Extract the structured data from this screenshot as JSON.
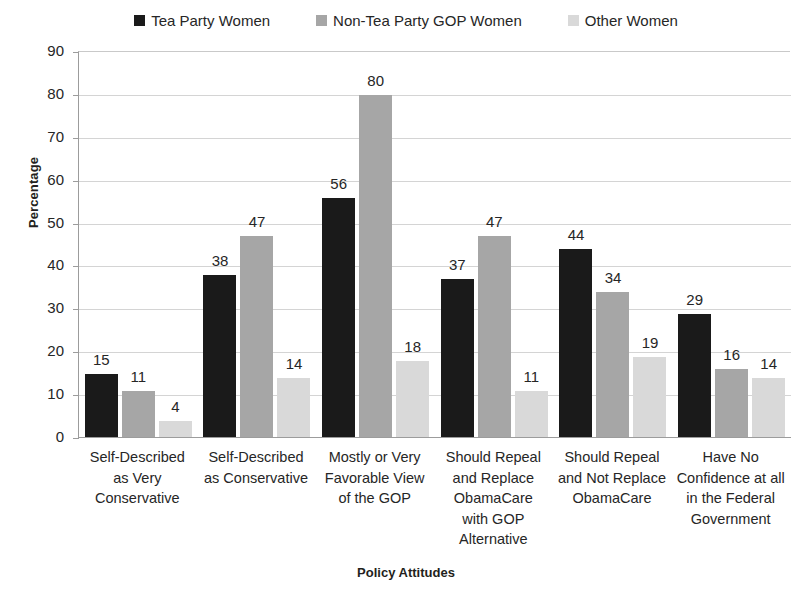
{
  "chart_data": {
    "type": "bar",
    "title": "",
    "xlabel": "Policy Attitudes",
    "ylabel": "Percentage",
    "ylim": [
      0,
      90
    ],
    "ytick_step": 10,
    "yticks": [
      90,
      80,
      70,
      60,
      50,
      40,
      30,
      20,
      10,
      0
    ],
    "grid": true,
    "legend_position": "top-center",
    "categories": [
      "Self-Described as Very Conservative",
      "Self-Described as Conservative",
      "Mostly or Very Favorable View of the GOP",
      "Should Repeal and Replace ObamaCare with GOP Alternative",
      "Should Repeal and Not Replace ObamaCare",
      "Have No Confidence at all in the Federal Government"
    ],
    "category_lines": [
      [
        "Self-Described",
        "as Very",
        "Conservative"
      ],
      [
        "Self-Described",
        "as Conservative"
      ],
      [
        "Mostly or Very",
        "Favorable View",
        "of the GOP"
      ],
      [
        "Should Repeal",
        "and Replace",
        "ObamaCare",
        "with GOP",
        "Alternative"
      ],
      [
        "Should Repeal",
        "and Not Replace",
        "ObamaCare"
      ],
      [
        "Have No",
        "Confidence at all",
        "in the Federal",
        "Government"
      ]
    ],
    "series": [
      {
        "name": "Tea Party Women",
        "color": "#1a1a1a",
        "values": [
          15,
          38,
          56,
          37,
          44,
          29
        ]
      },
      {
        "name": "Non-Tea Party GOP Women",
        "color": "#a6a6a6",
        "values": [
          11,
          47,
          80,
          47,
          34,
          16
        ]
      },
      {
        "name": "Other Women",
        "color": "#d9d9d9",
        "values": [
          4,
          14,
          18,
          11,
          19,
          14
        ]
      }
    ]
  },
  "legend": {
    "entries": [
      {
        "label": "Tea Party Women",
        "color": "#1a1a1a"
      },
      {
        "label": "Non-Tea Party GOP Women",
        "color": "#a6a6a6"
      },
      {
        "label": "Other Women",
        "color": "#d9d9d9"
      }
    ]
  },
  "axes": {
    "y_title": "Percentage",
    "x_title": "Policy Attitudes"
  }
}
